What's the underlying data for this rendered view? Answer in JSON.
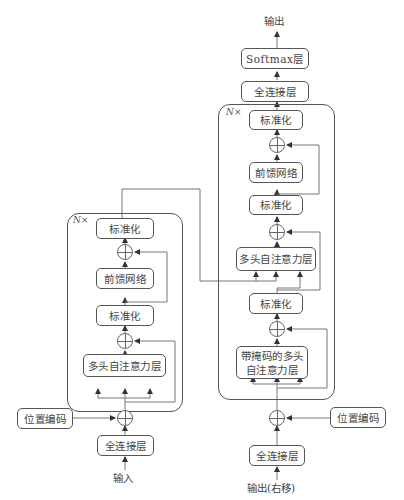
{
  "diagram": {
    "type": "Transformer architecture",
    "encoder": {
      "repeat_label": "N×",
      "input_label": "输入",
      "embedding": "全连接层",
      "positional_encoding": "位置编码",
      "layers": {
        "attention": "多头自注意力层",
        "norm1": "标准化",
        "ffn": "前馈网络",
        "norm2": "标准化"
      }
    },
    "decoder": {
      "repeat_label": "N×",
      "input_label": "输出(右移)",
      "embedding": "全连接层",
      "positional_encoding": "位置编码",
      "layers": {
        "masked_attention": "带掩码的多头自注意力层",
        "norm1": "标准化",
        "cross_attention": "多头自注意力层",
        "norm2": "标准化",
        "ffn": "前馈网络",
        "norm3": "标准化"
      },
      "output_linear": "全连接层",
      "softmax": "Softmax层",
      "output_label": "输出"
    }
  }
}
